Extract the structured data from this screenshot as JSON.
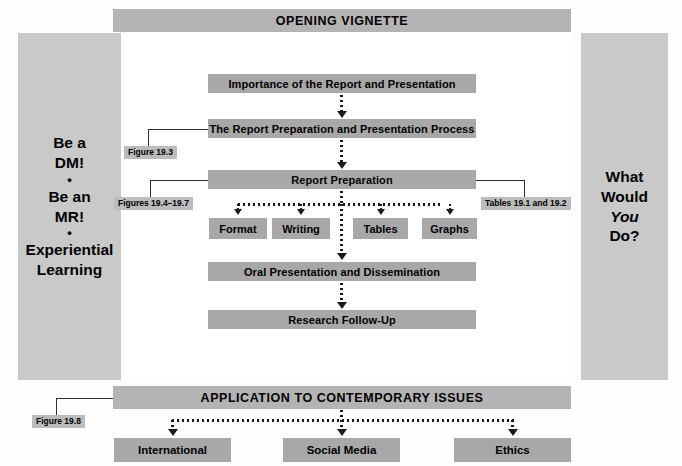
{
  "header": {
    "title": "OPENING VIGNETTE"
  },
  "left_panel": {
    "lines": [
      "Be a",
      "DM!",
      "Be an",
      "MR!",
      "Experiential",
      "Learning"
    ],
    "separator": "•",
    "line1": "Be a",
    "line2": "DM!",
    "line3": "Be an",
    "line4": "MR!",
    "line5": "Experiential",
    "line6": "Learning"
  },
  "right_panel": {
    "line1": "What",
    "line2": "Would",
    "line3": "You",
    "line4": "Do?"
  },
  "flow": {
    "boxes": [
      {
        "id": "importance",
        "label": "Importance of the Report and Presentation"
      },
      {
        "id": "process",
        "label": "The Report Preparation and Presentation Process"
      },
      {
        "id": "preparation",
        "label": "Report Preparation"
      },
      {
        "id": "oral",
        "label": "Oral Presentation and Dissemination"
      },
      {
        "id": "followup",
        "label": "Research Follow-Up"
      }
    ],
    "sub_boxes": [
      {
        "id": "format",
        "label": "Format"
      },
      {
        "id": "writing",
        "label": "Writing"
      },
      {
        "id": "tables",
        "label": "Tables"
      },
      {
        "id": "graphs",
        "label": "Graphs"
      }
    ]
  },
  "figure_tags": {
    "fig_193": "Figure 19.3",
    "fig_194_197": "Figures 19.4–19.7",
    "tables_191_192": "Tables 19.1 and 19.2",
    "fig_198": "Figure 19.8"
  },
  "application": {
    "title": "APPLICATION TO CONTEMPORARY ISSUES",
    "boxes": [
      {
        "id": "international",
        "label": "International"
      },
      {
        "id": "social-media",
        "label": "Social Media"
      },
      {
        "id": "ethics",
        "label": "Ethics"
      }
    ]
  },
  "colors": {
    "panel_grey": "#c9c9c9",
    "bar_grey": "#a8a8a8",
    "header_grey": "#b4b4b4",
    "tag_grey": "#bcbcbc",
    "line_black": "#1a1a1a",
    "background": "#fdfdfd"
  }
}
